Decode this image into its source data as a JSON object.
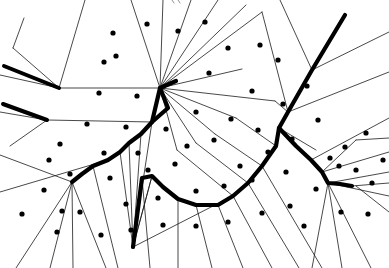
{
  "figure": {
    "type": "voronoi-diagram",
    "width": 389,
    "height": 268,
    "background_color": "#ffffff"
  },
  "style": {
    "cell_edge_color": "#1a1a1a",
    "cell_edge_width": 0.8,
    "path_color": "#000000",
    "path_width": 4.2,
    "site_color": "#000000",
    "site_radius": 2.6,
    "clip_mark_color": "#777777"
  },
  "chart_data": {
    "type": "scatter",
    "xlabel": "",
    "ylabel": "",
    "xlim": [
      0,
      389
    ],
    "ylim": [
      0,
      268
    ],
    "grid": false,
    "legend": "none",
    "sites": [
      [
        113,
        33
      ],
      [
        147,
        24
      ],
      [
        205,
        22
      ],
      [
        116,
        56
      ],
      [
        228,
        48
      ],
      [
        104,
        62
      ],
      [
        178,
        31
      ],
      [
        260,
        45
      ],
      [
        99,
        93
      ],
      [
        209,
        73
      ],
      [
        252,
        91
      ],
      [
        278,
        60
      ],
      [
        137,
        96
      ],
      [
        166,
        129
      ],
      [
        126,
        127
      ],
      [
        196,
        112
      ],
      [
        231,
        119
      ],
      [
        87,
        124
      ],
      [
        60,
        144
      ],
      [
        104,
        153
      ],
      [
        138,
        153
      ],
      [
        187,
        146
      ],
      [
        214,
        140
      ],
      [
        258,
        130
      ],
      [
        283,
        104
      ],
      [
        307,
        86
      ],
      [
        49,
        160
      ],
      [
        70,
        174
      ],
      [
        110,
        178
      ],
      [
        148,
        170
      ],
      [
        175,
        164
      ],
      [
        240,
        166
      ],
      [
        268,
        152
      ],
      [
        292,
        139
      ],
      [
        318,
        120
      ],
      [
        44,
        190
      ],
      [
        62,
        211
      ],
      [
        80,
        212
      ],
      [
        126,
        204
      ],
      [
        158,
        198
      ],
      [
        196,
        191
      ],
      [
        224,
        186
      ],
      [
        252,
        180
      ],
      [
        286,
        172
      ],
      [
        345,
        147
      ],
      [
        366,
        133
      ],
      [
        330,
        158
      ],
      [
        339,
        166
      ],
      [
        356,
        170
      ],
      [
        372,
        183
      ],
      [
        316,
        189
      ],
      [
        290,
        206
      ],
      [
        262,
        213
      ],
      [
        228,
        222
      ],
      [
        196,
        226
      ],
      [
        163,
        225
      ],
      [
        131,
        230
      ],
      [
        101,
        235
      ],
      [
        304,
        226
      ],
      [
        341,
        212
      ],
      [
        368,
        214
      ],
      [
        57,
        232
      ],
      [
        22,
        214
      ],
      [
        383,
        160
      ]
    ],
    "path_polyline": [
      [
        345,
        15
      ],
      [
        312,
        70
      ],
      [
        288,
        112
      ],
      [
        279,
        128
      ],
      [
        276,
        146
      ],
      [
        262,
        166
      ],
      [
        248,
        183
      ],
      [
        233,
        196
      ],
      [
        218,
        205
      ],
      [
        196,
        205
      ],
      [
        178,
        199
      ],
      [
        163,
        187
      ],
      [
        152,
        176
      ],
      [
        142,
        178
      ],
      [
        133,
        247
      ]
    ],
    "path_branch_hub": [
      [
        160,
        88
      ],
      [
        176,
        81
      ],
      [
        168,
        108
      ],
      [
        152,
        122
      ],
      [
        141,
        134
      ],
      [
        129,
        143
      ],
      [
        120,
        152
      ],
      [
        108,
        160
      ],
      [
        93,
        166
      ],
      [
        82,
        174
      ],
      [
        72,
        182
      ]
    ],
    "path_branch_right": [
      [
        279,
        128
      ],
      [
        296,
        146
      ],
      [
        311,
        160
      ],
      [
        322,
        172
      ],
      [
        328,
        183
      ],
      [
        340,
        184
      ],
      [
        352,
        186
      ]
    ],
    "path_stubs": [
      {
        "from": [
          4,
          66
        ],
        "to": [
          59,
          88
        ],
        "width": 4.0
      },
      {
        "from": [
          3,
          104
        ],
        "to": [
          47,
          120
        ],
        "width": 4.0
      }
    ]
  },
  "annotations": {
    "top_clip_mark": "partial mark clipped at top border",
    "hub_primary": "central junction vertex",
    "hub_secondary": "right-side junction vertex",
    "hub_left": "left-side junction vertex"
  }
}
